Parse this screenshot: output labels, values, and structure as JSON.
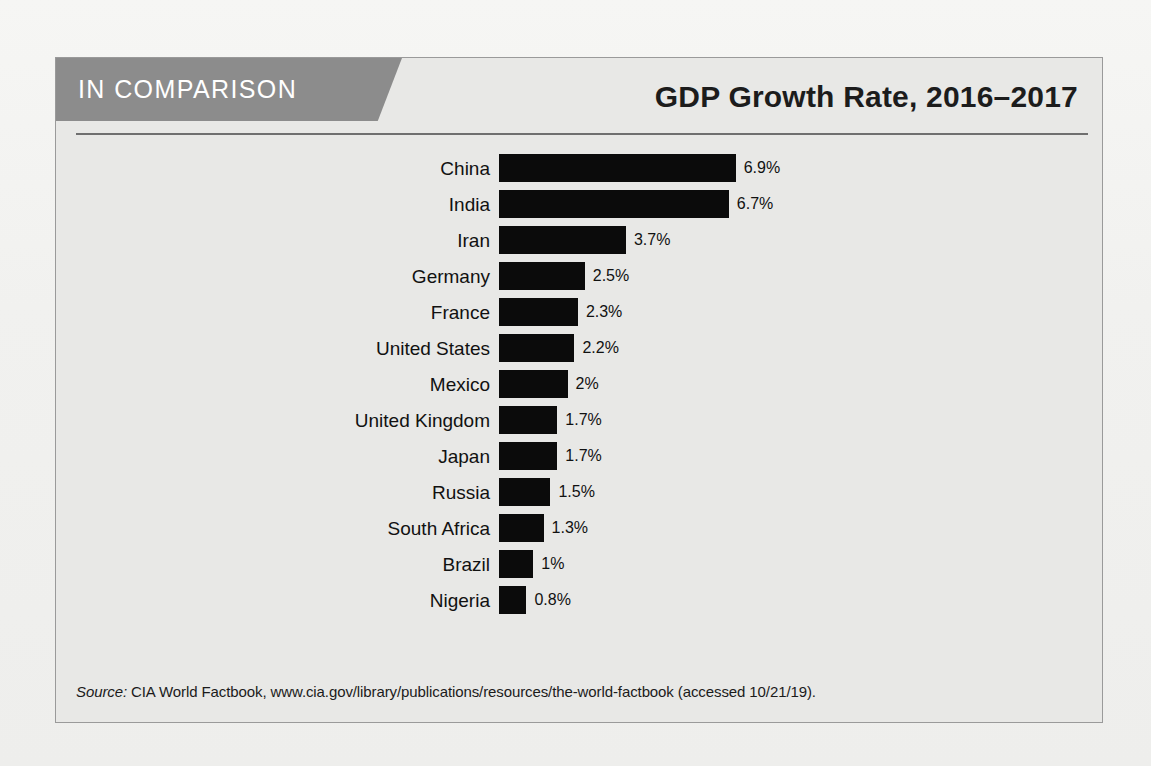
{
  "figure": {
    "banner_label": "IN COMPARISON",
    "title": "GDP Growth Rate, 2016–2017",
    "source_prefix": "Source:",
    "source_text": " CIA World Factbook, www.cia.gov/library/publications/resources/the-world-factbook (accessed 10/21/19).",
    "colors": {
      "banner_bg": "#8c8c8c",
      "bar": "#0b0b0b",
      "panel_bg": "#e8e8e6",
      "border": "#9a9a9a"
    }
  },
  "chart_data": {
    "type": "bar",
    "orientation": "horizontal",
    "title": "GDP Growth Rate, 2016–2017",
    "xlabel": "",
    "ylabel": "",
    "xlim": [
      0,
      7.2
    ],
    "grid": false,
    "legend": "none",
    "units": "percent",
    "categories": [
      "China",
      "India",
      "Iran",
      "Germany",
      "France",
      "United States",
      "Mexico",
      "United Kingdom",
      "Japan",
      "Russia",
      "South Africa",
      "Brazil",
      "Nigeria"
    ],
    "values": [
      6.9,
      6.7,
      3.7,
      2.5,
      2.3,
      2.2,
      2,
      1.7,
      1.7,
      1.5,
      1.3,
      1,
      0.8
    ],
    "value_labels": [
      "6.9%",
      "6.7%",
      "3.7%",
      "2.5%",
      "2.3%",
      "2.2%",
      "2%",
      "1.7%",
      "1.7%",
      "1.5%",
      "1.3%",
      "1%",
      "0.8%"
    ],
    "bars": [
      {
        "label": "China",
        "value": 6.9,
        "display": "6.9%"
      },
      {
        "label": "India",
        "value": 6.7,
        "display": "6.7%"
      },
      {
        "label": "Iran",
        "value": 3.7,
        "display": "3.7%"
      },
      {
        "label": "Germany",
        "value": 2.5,
        "display": "2.5%"
      },
      {
        "label": "France",
        "value": 2.3,
        "display": "2.3%"
      },
      {
        "label": "United States",
        "value": 2.2,
        "display": "2.2%"
      },
      {
        "label": "Mexico",
        "value": 2.0,
        "display": "2%"
      },
      {
        "label": "United Kingdom",
        "value": 1.7,
        "display": "1.7%"
      },
      {
        "label": "Japan",
        "value": 1.7,
        "display": "1.7%"
      },
      {
        "label": "Russia",
        "value": 1.5,
        "display": "1.5%"
      },
      {
        "label": "South Africa",
        "value": 1.3,
        "display": "1.3%"
      },
      {
        "label": "Brazil",
        "value": 1.0,
        "display": "1%"
      },
      {
        "label": "Nigeria",
        "value": 0.8,
        "display": "0.8%"
      }
    ],
    "px_per_unit": 34.3
  }
}
